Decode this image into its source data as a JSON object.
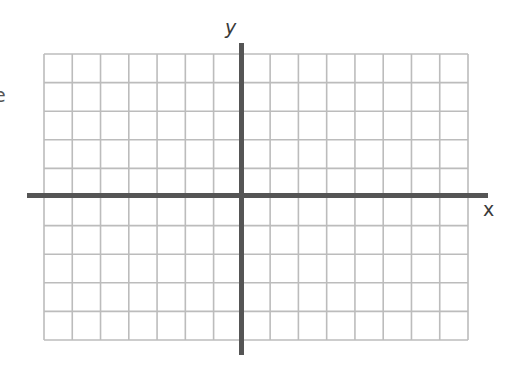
{
  "diagram": {
    "type": "coordinate-plane",
    "x_axis_label": "x",
    "y_axis_label": "y",
    "edge_fragment_text": "e",
    "grid": {
      "left": 44,
      "top": 54,
      "right": 468,
      "bottom": 340,
      "columns": 15,
      "rows": 10,
      "columns_left_of_y_axis": 7,
      "columns_right_of_y_axis": 8,
      "rows_above_x_axis": 5,
      "rows_below_x_axis": 5
    },
    "axes": {
      "x_axis": {
        "y": 195.5,
        "x_start": 27,
        "x_end": 488
      },
      "y_axis": {
        "x": 241.5,
        "y_start": 43,
        "y_end": 355
      }
    },
    "colors": {
      "grid_line": "#bcbcbc",
      "axis_line": "#555555",
      "label": "#3a3a3a",
      "background": "#ffffff"
    }
  }
}
